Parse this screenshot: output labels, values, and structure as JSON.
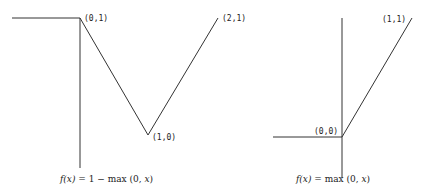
{
  "diagrams": [
    {
      "id": "left",
      "caption": "f(x) = 1 − max (0, x)",
      "caption_parts": {
        "func": "f(x)",
        "eq": " = 1 − max (0, ",
        "var": "x",
        "close": ")"
      },
      "points": [
        {
          "label": "(0,1)"
        },
        {
          "label": "(1,0)"
        },
        {
          "label": "(2,1)"
        }
      ]
    },
    {
      "id": "right",
      "caption": "f(x) = max (0, x)",
      "caption_parts": {
        "func": "f(x)",
        "eq": " = max (0, ",
        "var": "x",
        "close": ")"
      },
      "points": [
        {
          "label": "(0,0)"
        },
        {
          "label": "(1,1)"
        }
      ]
    }
  ],
  "colors": {
    "line": "#333333",
    "background": "#ffffff"
  }
}
